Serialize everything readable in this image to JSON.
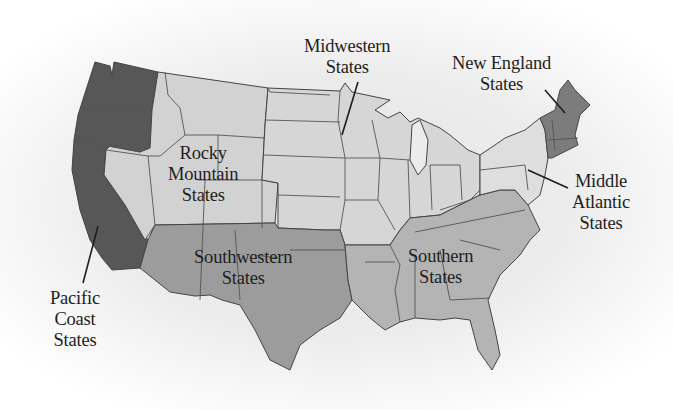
{
  "map": {
    "title": "U.S. regions",
    "colors": {
      "pacific_coast": "#575757",
      "rocky_mountain": "#d2d2d2",
      "midwestern": "#d6d6d6",
      "southwestern": "#9c9c9c",
      "southern": "#b4b4b4",
      "new_england": "#7c7c7c",
      "middle_atlantic": "#dedede",
      "border": "#444444",
      "label_text": "#1e1e1e"
    },
    "regions": [
      {
        "id": "midwestern",
        "lines": [
          "Midwestern",
          "States"
        ]
      },
      {
        "id": "new_england",
        "lines": [
          "New England",
          "States"
        ]
      },
      {
        "id": "rocky_mountain",
        "lines": [
          "Rocky",
          "Mountain",
          "States"
        ]
      },
      {
        "id": "middle_atlantic",
        "lines": [
          "Middle",
          "Atlantic",
          "States"
        ]
      },
      {
        "id": "southwestern",
        "lines": [
          "Southwestern",
          "States"
        ]
      },
      {
        "id": "southern",
        "lines": [
          "Southern",
          "States"
        ]
      },
      {
        "id": "pacific_coast",
        "lines": [
          "Pacific",
          "Coast",
          "States"
        ]
      }
    ]
  }
}
